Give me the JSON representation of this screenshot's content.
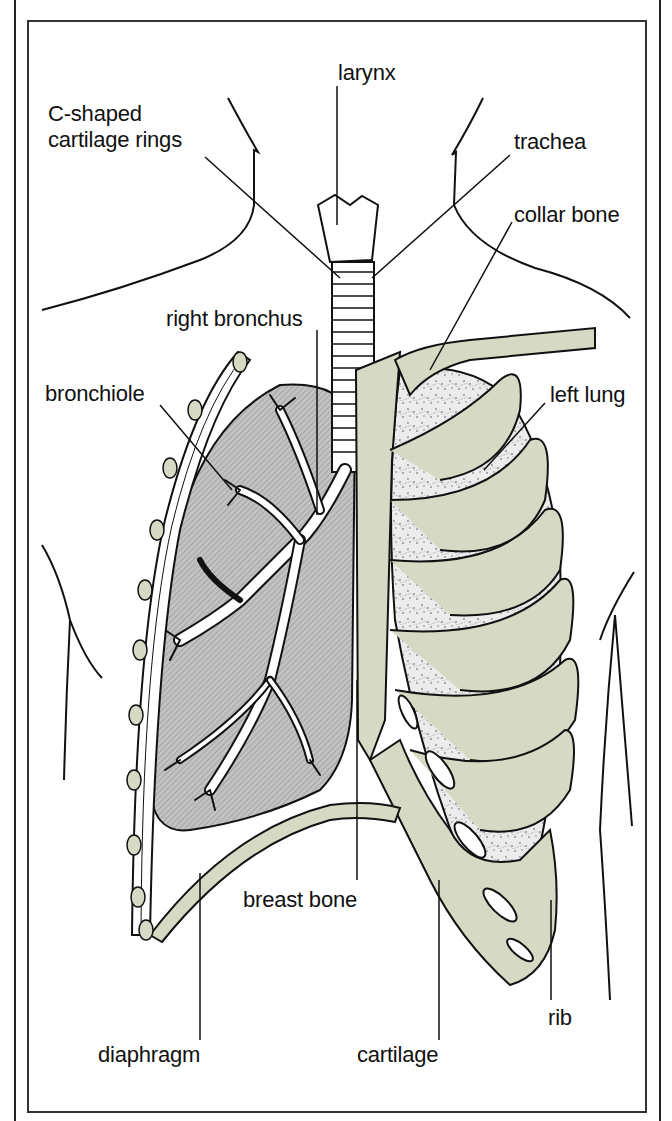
{
  "diagram": {
    "colors": {
      "bone": "#d6d9c3",
      "lung_right": "#b8b8b8",
      "lung_left": "#e6e6e6",
      "outline": "#111111",
      "background": "#ffffff"
    },
    "labels": {
      "larynx": "larynx",
      "c_shaped_line1": "C-shaped",
      "c_shaped_line2": "cartilage rings",
      "trachea": "trachea",
      "collar_bone": "collar bone",
      "right_bronchus": "right bronchus",
      "bronchiole": "bronchiole",
      "left_lung": "left lung",
      "breast_bone": "breast bone",
      "rib": "rib",
      "diaphragm": "diaphragm",
      "cartilage": "cartilage"
    }
  }
}
